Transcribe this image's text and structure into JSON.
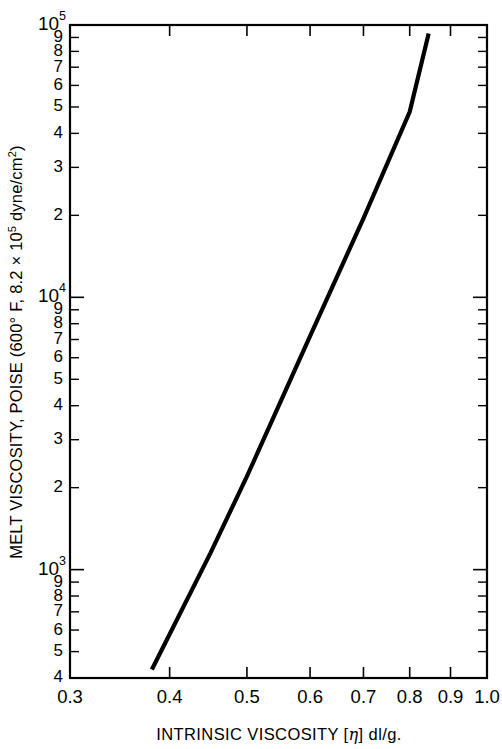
{
  "chart_data": {
    "type": "line",
    "title": "",
    "subtitle": "",
    "xlabel": "INTRINSIC VISCOSITY [η] dl/g.",
    "ylabel": "MELT VISCOSITY, POISE (600° F, 8.2 × 10⁵ dyne/cm²)",
    "xscale": "log",
    "yscale": "log",
    "xlim": [
      0.3,
      1.0
    ],
    "ylim": [
      400,
      100000
    ],
    "grid": false,
    "legend": null,
    "x_tick_labels": [
      "0.3",
      "0.4",
      "0.5",
      "0.6",
      "0.7",
      "0.8",
      "0.9",
      "1.0"
    ],
    "x_tick_values": [
      0.3,
      0.4,
      0.5,
      0.6,
      0.7,
      0.8,
      0.9,
      1.0
    ],
    "y_tick_values": [
      400,
      500,
      600,
      700,
      800,
      900,
      1000,
      2000,
      3000,
      4000,
      5000,
      6000,
      7000,
      8000,
      9000,
      10000,
      20000,
      30000,
      40000,
      50000,
      60000,
      70000,
      80000,
      90000,
      100000
    ],
    "y_tick_labels": [
      "4",
      "5",
      "6",
      "7",
      "8",
      "9",
      "10³",
      "2",
      "3",
      "4",
      "5",
      "6",
      "7",
      "8",
      "9",
      "10⁴",
      "2",
      "3",
      "4",
      "5",
      "6",
      "7",
      "8",
      "9",
      "10⁵"
    ],
    "y_decade_labels": [
      {
        "value": 1000,
        "mantissa": "10",
        "exponent": "3"
      },
      {
        "value": 10000,
        "mantissa": "10",
        "exponent": "4"
      },
      {
        "value": 100000,
        "mantissa": "10",
        "exponent": "5"
      }
    ],
    "series": [
      {
        "name": "melt viscosity vs intrinsic viscosity",
        "style": "solid-straight-line",
        "color": "#000000",
        "x": [
          0.38,
          0.845
        ],
        "y": [
          430,
          93000
        ],
        "points": [
          {
            "x": 0.38,
            "y": 430
          },
          {
            "x": 0.45,
            "y": 1150
          },
          {
            "x": 0.5,
            "y": 2200
          },
          {
            "x": 0.6,
            "y": 7200
          },
          {
            "x": 0.7,
            "y": 19500
          },
          {
            "x": 0.8,
            "y": 48000
          },
          {
            "x": 0.845,
            "y": 93000
          }
        ]
      }
    ]
  },
  "figure": {
    "ytitle_parts": {
      "a": "MELT VISCOSITY, POISE (600° F, 8.2 × 10",
      "sup1": "5",
      "b": " dyne/cm",
      "sup2": "2",
      "c": ")"
    },
    "xtitle_parts": {
      "a": "INTRINSIC VISCOSITY [",
      "eta": "η",
      "b": "] dl/g."
    },
    "colors": {
      "line": "#000000",
      "axis": "#000000",
      "background": "#ffffff"
    }
  }
}
